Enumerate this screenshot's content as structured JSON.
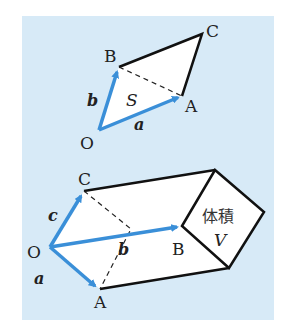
{
  "colors": {
    "panel_bg": "#d7eaf7",
    "vector": "#3a8fd8",
    "edge": "#111111",
    "face": "#ffffff"
  },
  "top_figure": {
    "description": "Parallelogram spanned by vectors a and b with triangle area S",
    "points": {
      "O": "O",
      "A": "A",
      "B": "B",
      "C": "C"
    },
    "vectors": {
      "a": "a",
      "b": "b"
    },
    "area_label": "S"
  },
  "bottom_figure": {
    "description": "Parallelepiped spanned by vectors a, b, c with volume V",
    "points": {
      "O": "O",
      "A": "A",
      "B": "B",
      "C": "C"
    },
    "vectors": {
      "a": "a",
      "b": "b",
      "c": "c"
    },
    "volume_text": "体積",
    "volume_label": "V"
  }
}
